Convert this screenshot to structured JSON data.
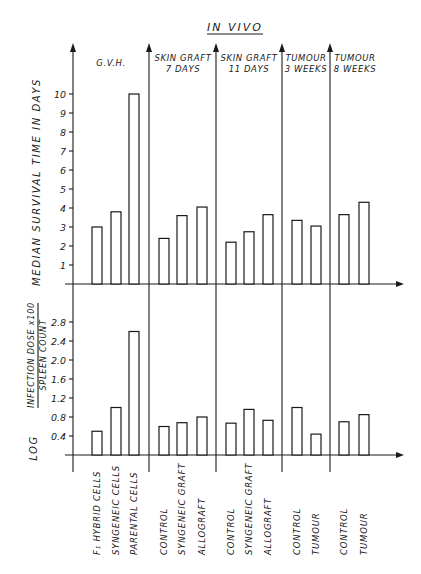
{
  "chart_data": [
    {
      "type": "bar",
      "title": "IN VIVO",
      "ylabel": "MEDIAN SURVIVAL TIME IN DAYS",
      "ylim": [
        0,
        11
      ],
      "yticks": [
        1,
        2,
        3,
        4,
        5,
        6,
        7,
        8,
        9,
        10
      ],
      "grid": false,
      "groups": [
        {
          "name": "G.V.H.",
          "categories": [
            "F1 HYBRID CELLS",
            "SYNGENEIC CELLS",
            "PARENTAL CELLS"
          ],
          "values": [
            3.0,
            3.8,
            10.0
          ]
        },
        {
          "name": "SKIN GRAFT 7 DAYS",
          "categories": [
            "CONTROL",
            "SYNGENEIC GRAFT",
            "ALLOGRAFT"
          ],
          "values": [
            2.4,
            3.6,
            4.05
          ]
        },
        {
          "name": "SKIN GRAFT 11 DAYS",
          "categories": [
            "CONTROL",
            "SYNGENEIC GRAFT",
            "ALLOGRAFT"
          ],
          "values": [
            2.2,
            2.75,
            3.65
          ]
        },
        {
          "name": "TUMOUR 3 WEEKS",
          "categories": [
            "CONTROL",
            "TUMOUR"
          ],
          "values": [
            3.35,
            3.05
          ]
        },
        {
          "name": "TUMOUR 8 WEEKS",
          "categories": [
            "CONTROL",
            "TUMOUR"
          ],
          "values": [
            3.65,
            4.3
          ]
        }
      ]
    },
    {
      "type": "bar",
      "ylabel": "LOG (INFECTION DOSE x100 / SPLEEN COUNT)",
      "ylim": [
        0,
        3.2
      ],
      "yticks": [
        0.4,
        0.8,
        1.2,
        1.6,
        2.0,
        2.4,
        2.8
      ],
      "grid": false,
      "groups": [
        {
          "name": "G.V.H.",
          "categories": [
            "F1 HYBRID CELLS",
            "SYNGENEIC CELLS",
            "PARENTAL CELLS"
          ],
          "values": [
            0.5,
            1.0,
            2.6
          ]
        },
        {
          "name": "SKIN GRAFT 7 DAYS",
          "categories": [
            "CONTROL",
            "SYNGENEIC GRAFT",
            "ALLOGRAFT"
          ],
          "values": [
            0.6,
            0.68,
            0.8
          ]
        },
        {
          "name": "SKIN GRAFT 11 DAYS",
          "categories": [
            "CONTROL",
            "SYNGENEIC GRAFT",
            "ALLOGRAFT"
          ],
          "values": [
            0.67,
            0.96,
            0.73
          ]
        },
        {
          "name": "TUMOUR 3 WEEKS",
          "categories": [
            "CONTROL",
            "TUMOUR"
          ],
          "values": [
            1.0,
            0.44
          ]
        },
        {
          "name": "TUMOUR 8 WEEKS",
          "categories": [
            "CONTROL",
            "TUMOUR"
          ],
          "values": [
            0.7,
            0.85
          ]
        }
      ]
    }
  ],
  "labels": {
    "title": "IN VIVO",
    "headers": [
      {
        "line1": "G.V.H.",
        "line2": ""
      },
      {
        "line1": "SKIN GRAFT",
        "line2": "7 DAYS"
      },
      {
        "line1": "SKIN GRAFT",
        "line2": "11 DAYS"
      },
      {
        "line1": "TUMOUR",
        "line2": "3 WEEKS"
      },
      {
        "line1": "TUMOUR",
        "line2": "8 WEEKS"
      }
    ],
    "upper_ylabel": "MEDIAN  SURVIVAL  TIME  IN  DAYS",
    "upper_ticks": [
      "1",
      "2",
      "3",
      "4",
      "5",
      "6",
      "7",
      "8",
      "9",
      "10"
    ],
    "lower_ylabel_log": "LOG",
    "lower_ylabel_num": "INFECTION DOSE x100",
    "lower_ylabel_den": "SPLEEN COUNT",
    "lower_ticks": [
      "0.4",
      "0.8",
      "1.2",
      "1.6",
      "2.0",
      "2.4",
      "2.8"
    ],
    "x_labels": [
      "F₁ HYBRID CELLS",
      "SYNGENEIC  CELLS",
      "PARENTAL  CELLS",
      "CONTROL",
      "SYNGENEIC  GRAFT",
      "ALLOGRAFT",
      "CONTROL",
      "SYNGENEIC  GRAFT",
      "ALLOGRAFT",
      "CONTROL",
      "TUMOUR",
      "CONTROL",
      "TUMOUR"
    ]
  }
}
